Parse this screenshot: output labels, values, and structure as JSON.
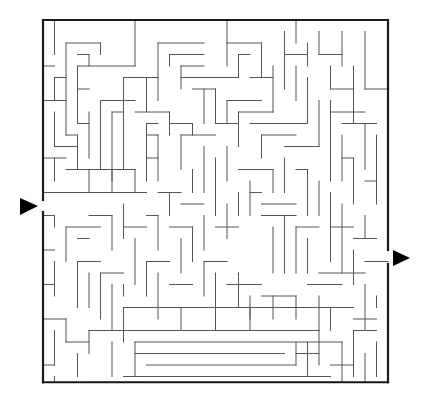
{
  "maze": {
    "origin": [
      43,
      20
    ],
    "cell": 11.5,
    "cols": 30,
    "rows": 31.5,
    "colors": {
      "wall": "#555555",
      "border": "#1a1a1a",
      "arrow": "#000000",
      "background": "#ffffff"
    },
    "entry": {
      "side": "left",
      "gap_y": [
        200,
        212
      ],
      "arrow": [
        [
          20,
          198
        ],
        [
          38,
          206
        ],
        [
          20,
          215
        ]
      ],
      "icon": "entry-arrow-icon"
    },
    "exit": {
      "side": "right",
      "gap_y": [
        250,
        264
      ],
      "arrow": [
        [
          393,
          250
        ],
        [
          410,
          258
        ],
        [
          393,
          266
        ]
      ],
      "icon": "exit-arrow-icon"
    },
    "walls": [
      [
        1,
        0,
        1,
        3
      ],
      [
        0,
        4,
        1,
        4
      ],
      [
        2,
        2,
        2,
        10
      ],
      [
        2,
        2,
        5,
        2
      ],
      [
        5,
        2,
        5,
        3
      ],
      [
        3,
        3,
        4,
        3
      ],
      [
        4,
        3,
        4,
        4
      ],
      [
        3,
        4,
        3,
        9
      ],
      [
        3,
        4,
        8,
        4
      ],
      [
        8,
        0,
        8,
        4
      ],
      [
        1,
        5,
        2,
        5
      ],
      [
        1,
        5,
        1,
        7
      ],
      [
        3,
        6,
        4,
        6
      ],
      [
        3,
        9,
        4,
        9
      ],
      [
        4,
        8,
        4,
        12
      ],
      [
        2,
        10,
        3,
        10
      ],
      [
        3,
        10,
        3,
        13
      ],
      [
        0,
        7,
        2,
        7
      ],
      [
        1,
        8,
        1,
        11
      ],
      [
        1,
        11,
        3,
        11
      ],
      [
        7,
        5,
        10,
        5
      ],
      [
        7,
        5,
        7,
        13
      ],
      [
        9,
        5,
        9,
        8
      ],
      [
        10,
        2,
        14,
        2
      ],
      [
        10,
        2,
        10,
        7
      ],
      [
        11,
        3,
        14,
        3
      ],
      [
        11,
        3,
        11,
        4
      ],
      [
        12,
        4,
        14,
        4
      ],
      [
        12,
        4,
        12,
        6
      ],
      [
        12,
        5,
        17,
        5
      ],
      [
        13,
        6,
        15,
        6
      ],
      [
        5,
        7,
        8,
        7
      ],
      [
        5,
        7,
        5,
        13
      ],
      [
        6,
        8,
        7,
        8
      ],
      [
        6,
        8,
        6,
        14
      ],
      [
        8,
        8,
        11,
        8
      ],
      [
        11,
        8,
        11,
        10
      ],
      [
        11,
        9,
        13,
        9
      ],
      [
        13,
        9,
        13,
        10
      ],
      [
        9,
        9,
        10,
        9
      ],
      [
        9,
        9,
        9,
        14
      ],
      [
        9,
        10,
        10,
        10
      ],
      [
        9,
        12,
        10,
        12
      ],
      [
        10,
        10,
        10,
        14
      ],
      [
        12,
        10,
        12,
        13
      ],
      [
        12,
        10,
        15,
        10
      ],
      [
        14,
        6,
        14,
        9
      ],
      [
        13,
        13,
        13,
        15
      ],
      [
        15,
        6,
        15,
        9
      ],
      [
        15,
        9,
        17,
        9
      ],
      [
        16,
        0,
        16,
        4
      ],
      [
        16,
        2,
        19,
        2
      ],
      [
        19,
        2,
        19,
        5
      ],
      [
        17,
        3,
        18,
        3
      ],
      [
        17,
        3,
        17,
        5
      ],
      [
        18,
        5,
        20,
        5
      ],
      [
        20,
        4,
        20,
        8
      ],
      [
        21,
        1,
        21,
        6
      ],
      [
        21,
        3,
        23,
        3
      ],
      [
        22,
        4,
        22,
        7
      ],
      [
        23,
        2,
        23,
        4
      ],
      [
        24,
        1,
        24,
        3
      ],
      [
        24,
        3,
        26,
        3
      ],
      [
        25,
        4,
        25,
        6
      ],
      [
        25,
        6,
        27,
        6
      ],
      [
        27,
        4,
        27,
        9
      ],
      [
        28,
        1,
        28,
        6
      ],
      [
        28,
        6,
        30,
        6
      ],
      [
        22,
        0,
        22,
        2
      ],
      [
        26,
        1,
        26,
        4
      ],
      [
        16,
        7,
        19,
        7
      ],
      [
        16,
        7,
        16,
        9
      ],
      [
        17,
        8,
        20,
        8
      ],
      [
        17,
        8,
        17,
        11
      ],
      [
        18,
        9,
        23,
        9
      ],
      [
        23,
        9,
        23,
        5
      ],
      [
        19,
        10,
        22,
        10
      ],
      [
        19,
        10,
        19,
        12
      ],
      [
        21,
        11,
        24,
        11
      ],
      [
        24,
        11,
        24,
        7
      ],
      [
        25,
        7,
        25,
        14
      ],
      [
        25,
        8,
        28,
        8
      ],
      [
        26,
        9,
        29,
        9
      ],
      [
        28,
        9,
        28,
        13
      ],
      [
        26,
        10,
        26,
        14
      ],
      [
        26,
        12,
        27,
        12
      ],
      [
        27,
        12,
        27,
        16
      ],
      [
        29,
        10,
        29,
        16
      ],
      [
        28,
        14,
        29,
        14
      ],
      [
        16,
        11,
        16,
        14
      ],
      [
        14,
        11,
        14,
        15
      ],
      [
        15,
        12,
        15,
        17
      ],
      [
        17,
        13,
        20,
        13
      ],
      [
        20,
        13,
        20,
        15
      ],
      [
        18,
        14,
        18,
        17
      ],
      [
        21,
        12,
        21,
        15
      ],
      [
        22,
        13,
        23,
        13
      ],
      [
        23,
        13,
        23,
        17
      ],
      [
        24,
        14,
        24,
        17
      ],
      [
        19,
        16,
        22,
        16
      ],
      [
        0,
        12,
        2,
        12
      ],
      [
        1,
        12,
        1,
        14
      ],
      [
        2,
        13,
        8,
        13
      ],
      [
        4,
        13,
        4,
        15
      ],
      [
        6,
        13,
        6,
        15
      ],
      [
        8,
        13,
        8,
        15
      ],
      [
        0,
        15,
        9,
        15
      ],
      [
        10,
        15,
        12,
        15
      ],
      [
        11,
        15,
        11,
        17
      ],
      [
        12,
        16,
        14,
        16
      ],
      [
        0,
        17,
        1,
        17
      ],
      [
        1,
        17,
        1,
        18
      ],
      [
        2,
        18,
        2,
        21
      ],
      [
        2,
        18,
        5,
        18
      ],
      [
        3,
        19,
        4,
        19
      ],
      [
        4,
        17,
        6,
        17
      ],
      [
        6,
        17,
        6,
        20
      ],
      [
        7,
        16,
        7,
        19
      ],
      [
        7,
        18,
        9,
        18
      ],
      [
        8,
        19,
        8,
        23
      ],
      [
        9,
        17,
        10,
        17
      ],
      [
        10,
        17,
        10,
        20
      ],
      [
        11,
        18,
        13,
        18
      ],
      [
        13,
        18,
        13,
        21
      ],
      [
        12,
        19,
        12,
        22
      ],
      [
        14,
        17,
        14,
        20
      ],
      [
        15,
        18,
        17,
        18
      ],
      [
        16,
        16,
        16,
        19
      ],
      [
        17,
        15,
        17,
        17
      ],
      [
        18,
        15,
        19,
        15
      ],
      [
        19,
        17,
        22,
        17
      ],
      [
        20,
        18,
        20,
        22
      ],
      [
        21,
        17,
        21,
        22
      ],
      [
        22,
        18,
        24,
        18
      ],
      [
        22,
        18,
        22,
        22
      ],
      [
        23,
        19,
        23,
        22
      ],
      [
        25,
        18,
        27,
        18
      ],
      [
        25,
        15,
        25,
        21
      ],
      [
        26,
        16,
        26,
        22
      ],
      [
        27,
        19,
        29,
        19
      ],
      [
        28,
        17,
        28,
        19
      ],
      [
        28,
        21,
        30,
        21
      ],
      [
        27,
        20,
        27,
        23
      ],
      [
        24,
        22,
        28,
        22
      ],
      [
        0,
        20,
        1,
        20
      ],
      [
        1,
        21,
        1,
        24
      ],
      [
        0,
        23,
        1,
        23
      ],
      [
        3,
        21,
        5,
        21
      ],
      [
        3,
        21,
        3,
        25
      ],
      [
        4,
        22,
        4,
        25
      ],
      [
        5,
        22,
        7,
        22
      ],
      [
        5,
        22,
        5,
        26
      ],
      [
        6,
        23,
        6,
        27
      ],
      [
        7,
        23,
        7,
        24
      ],
      [
        9,
        21,
        11,
        21
      ],
      [
        9,
        21,
        9,
        24
      ],
      [
        10,
        22,
        10,
        26
      ],
      [
        11,
        23,
        13,
        23
      ],
      [
        14,
        21,
        16,
        21
      ],
      [
        14,
        21,
        14,
        24
      ],
      [
        15,
        22,
        15,
        25
      ],
      [
        16,
        23,
        19,
        23
      ],
      [
        17,
        22,
        17,
        25
      ],
      [
        18,
        24,
        18,
        26
      ],
      [
        19,
        24,
        22,
        24
      ],
      [
        20,
        24,
        20,
        26
      ],
      [
        22,
        24,
        22,
        26
      ],
      [
        23,
        23,
        26,
        23
      ],
      [
        24,
        24,
        24,
        27
      ],
      [
        25,
        25,
        27,
        25
      ],
      [
        28,
        23,
        28,
        27
      ],
      [
        27,
        26,
        29,
        26
      ],
      [
        29,
        24,
        29,
        25
      ],
      [
        0,
        26,
        2,
        26
      ],
      [
        2,
        26,
        2,
        28
      ],
      [
        1,
        27,
        1,
        30
      ],
      [
        2,
        28,
        4,
        28
      ],
      [
        3,
        29,
        3,
        31
      ],
      [
        4,
        27,
        6,
        27
      ],
      [
        4,
        27,
        4,
        29
      ],
      [
        6,
        27,
        24,
        27
      ],
      [
        6,
        28,
        6,
        31
      ],
      [
        7,
        25,
        25,
        25
      ],
      [
        7,
        25,
        7,
        28
      ],
      [
        12,
        25,
        12,
        27
      ],
      [
        15,
        25,
        15,
        27
      ],
      [
        18,
        25,
        18,
        27
      ],
      [
        25,
        25,
        25,
        27
      ],
      [
        8,
        28,
        26,
        28
      ],
      [
        8,
        29,
        21,
        29
      ],
      [
        22,
        29,
        24,
        29
      ],
      [
        8,
        28,
        8,
        31
      ],
      [
        9,
        30,
        22,
        30
      ],
      [
        22,
        30,
        22,
        28
      ],
      [
        23,
        28,
        23,
        31
      ],
      [
        24,
        27,
        24,
        30
      ],
      [
        7,
        31,
        25,
        31
      ],
      [
        4,
        32,
        9,
        32
      ],
      [
        10,
        32,
        26,
        32
      ],
      [
        26,
        28,
        26,
        32
      ],
      [
        27,
        27,
        29,
        27
      ],
      [
        27,
        27,
        27,
        31
      ],
      [
        28,
        29,
        28,
        32
      ],
      [
        29,
        28,
        29,
        31
      ],
      [
        25,
        30,
        27,
        30
      ],
      [
        0,
        30,
        1,
        30
      ],
      [
        1,
        31,
        1,
        32
      ]
    ]
  }
}
